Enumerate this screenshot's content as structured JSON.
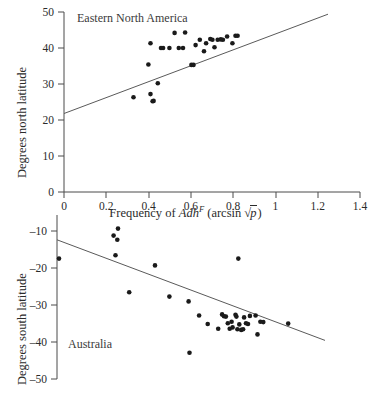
{
  "figure": {
    "xaxis_title_prefix": "Frequency of ",
    "xaxis_title_gene": "Adh",
    "xaxis_title_superscript": "F",
    "xaxis_title_transform_open": "(arcsin ",
    "xaxis_title_radicand": "p",
    "xaxis_title_transform_close": ")"
  },
  "chart_data": [
    {
      "type": "scatter",
      "title": "",
      "annotation": "Eastern North America",
      "xlabel": "Frequency of Adh^F (arcsin √p)",
      "ylabel": "Degrees north latitude",
      "xlim": [
        0,
        1.4
      ],
      "ylim": [
        0,
        50
      ],
      "xticks": [
        0,
        0.2,
        0.4,
        0.6,
        0.8,
        1,
        1.2,
        1.4
      ],
      "xticklabels": [
        "0",
        "0.2",
        "0.4",
        "0.6",
        "0.8",
        "1",
        "1.2",
        "1.4"
      ],
      "yticks": [
        0,
        10,
        20,
        30,
        40,
        50
      ],
      "yticklabels": [
        "0",
        "10",
        "20",
        "30",
        "40",
        "50"
      ],
      "grid": false,
      "legend": "none",
      "trendline": {
        "x": [
          0.0,
          1.25
        ],
        "y": [
          21.8,
          49.5
        ]
      },
      "x": [
        0.33,
        0.4,
        0.41,
        0.41,
        0.425,
        0.42,
        0.445,
        0.46,
        0.47,
        0.5,
        0.525,
        0.545,
        0.565,
        0.575,
        0.605,
        0.615,
        0.625,
        0.645,
        0.665,
        0.675,
        0.695,
        0.705,
        0.715,
        0.73,
        0.745,
        0.755,
        0.775,
        0.8,
        0.815,
        0.825
      ],
      "y": [
        26.3,
        35.4,
        41.3,
        27.2,
        25.3,
        25.2,
        30.2,
        40.0,
        40.0,
        40.0,
        44.2,
        40.0,
        40.0,
        44.3,
        35.3,
        35.3,
        40.8,
        42.3,
        39.1,
        41.3,
        42.5,
        42.3,
        40.2,
        42.3,
        42.4,
        42.3,
        43.2,
        41.3,
        43.4,
        43.4
      ]
    },
    {
      "type": "scatter",
      "title": "",
      "annotation": "Australia",
      "xlabel": "Frequency of Adh^F (arcsin √p)",
      "ylabel": "Degrees south latitude",
      "xlim": [
        0,
        1.4
      ],
      "ylim": [
        -50,
        -5
      ],
      "yticks": [
        -10,
        -20,
        -30,
        -40,
        -50
      ],
      "yticklabels": [
        "–10",
        "–20",
        "–30",
        "–40",
        "–50"
      ],
      "grid": false,
      "legend": "none",
      "trendline": {
        "x": [
          0.0,
          1.12
        ],
        "y": [
          -12.4,
          -39.6
        ]
      },
      "x": [
        0.01,
        0.33,
        0.305,
        0.325,
        0.315,
        0.39,
        0.525,
        0.6,
        0.7,
        0.705,
        0.755,
        0.8,
        0.855,
        0.875,
        0.885,
        0.895,
        0.905,
        0.915,
        0.925,
        0.93,
        0.945,
        0.95,
        0.955,
        0.96,
        0.965,
        0.975,
        0.985,
        0.99,
        1.0,
        1.01,
        1.02,
        1.05,
        1.06,
        1.075,
        1.09,
        1.22
      ],
      "y": [
        -17.3,
        -9.2,
        -11.1,
        -12.2,
        -16.4,
        -26.4,
        -19.2,
        -27.6,
        -28.9,
        -42.8,
        -32.7,
        -35.0,
        -36.3,
        -32.4,
        -32.9,
        -33.0,
        -34.8,
        -36.3,
        -34.4,
        -35.9,
        -32.5,
        -33.0,
        -36.4,
        -17.3,
        -35.1,
        -36.6,
        -36.4,
        -33.2,
        -34.8,
        -35.0,
        -32.8,
        -32.7,
        -37.8,
        -34.4,
        -34.5,
        -34.9
      ]
    }
  ]
}
